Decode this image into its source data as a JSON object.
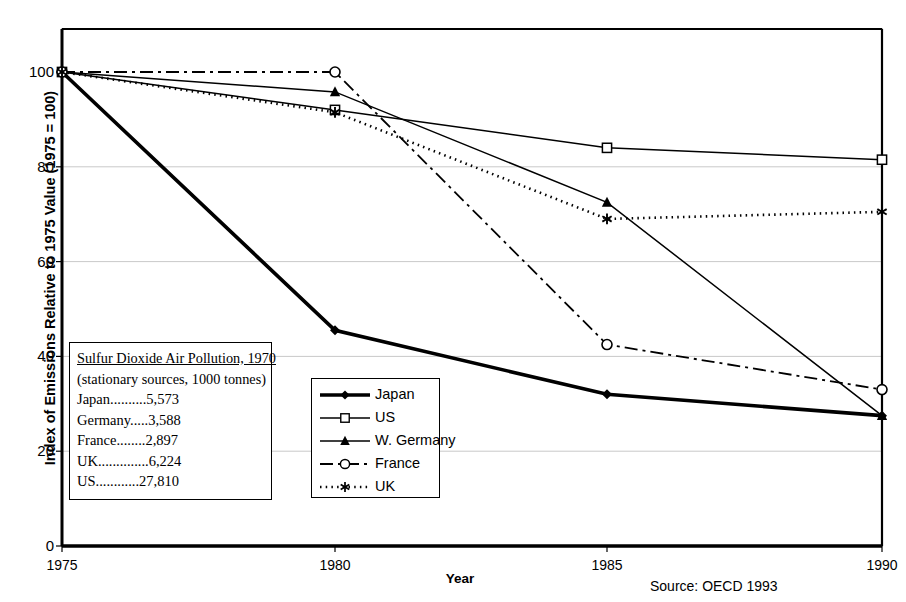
{
  "chart_data": {
    "type": "line",
    "title": "",
    "xlabel": "Year",
    "ylabel": "Index of Emissions Relative to 1975 Value (1975 = 100)",
    "x": [
      1975,
      1980,
      1985,
      1990
    ],
    "xlim": [
      1975,
      1990
    ],
    "ylim": [
      0,
      105
    ],
    "yticks": [
      0,
      20,
      40,
      60,
      80,
      100
    ],
    "xticks": [
      "1975",
      "1980",
      "1985",
      "1990"
    ],
    "grid": "horizontal",
    "legend_position": "lower-center-left",
    "series": [
      {
        "name": "Japan",
        "values": [
          100,
          45.5,
          32.0,
          27.5
        ],
        "marker": "filled-diamond",
        "line": "solid-thick"
      },
      {
        "name": "US",
        "values": [
          100,
          92.0,
          84.0,
          81.5
        ],
        "marker": "open-square",
        "line": "solid"
      },
      {
        "name": "W. Germany",
        "values": [
          100,
          95.8,
          72.5,
          27.5
        ],
        "marker": "filled-triangle",
        "line": "solid"
      },
      {
        "name": "France",
        "values": [
          100,
          100.0,
          42.5,
          33.0
        ],
        "marker": "open-circle",
        "line": "dash-dot"
      },
      {
        "name": "UK",
        "values": [
          100,
          91.5,
          69.0,
          70.5
        ],
        "marker": "asterisk",
        "line": "dotted"
      }
    ],
    "annotation_box": {
      "title": "Sulfur Dioxide Air Pollution, 1970",
      "subtitle": "(stationary sources, 1000 tonnes)",
      "rows": [
        {
          "label": "Japan",
          "dots": "..........",
          "value": "5,573"
        },
        {
          "label": "Germany",
          "dots": ".....",
          "value": "3,588"
        },
        {
          "label": "France",
          "dots": "........",
          "value": "2,897"
        },
        {
          "label": "UK",
          "dots": "..............",
          "value": "6,224"
        },
        {
          "label": "US",
          "dots": "............",
          "value": "27,810"
        }
      ]
    },
    "source": "Source: OECD 1993",
    "colors": {
      "line": "#000000",
      "grid": "#c9c9c9",
      "axis": "#000000",
      "background": "#ffffff"
    }
  },
  "axes": {
    "y_tick_labels": [
      "100",
      "80",
      "60",
      "40",
      "20",
      "0"
    ],
    "x_tick_labels": [
      "1975",
      "1980",
      "1985",
      "1990"
    ],
    "y_title": "Index of Emissions Relative to 1975 Value (1975 = 100)",
    "x_title": "Year"
  },
  "legend": {
    "items": [
      {
        "label": "Japan"
      },
      {
        "label": "US"
      },
      {
        "label": "W. Germany"
      },
      {
        "label": "France"
      },
      {
        "label": "UK"
      }
    ]
  },
  "footer": {
    "source": "Source: OECD 1993"
  }
}
